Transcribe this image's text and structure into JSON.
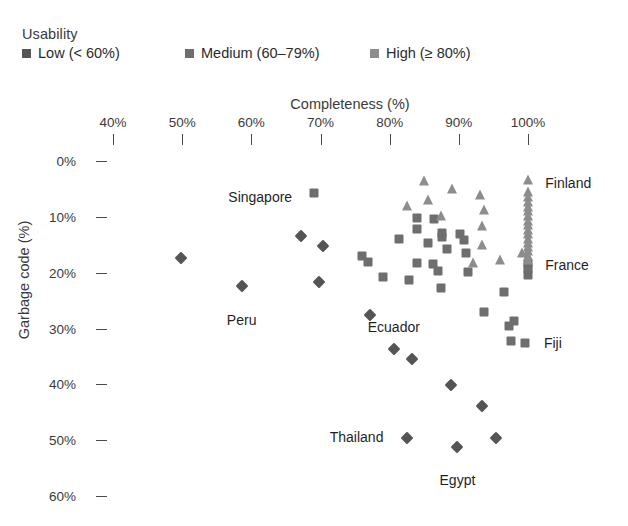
{
  "legend": {
    "title": "Usability",
    "items": [
      {
        "label": "Low (< 60%)",
        "color": "#555555",
        "shape": "diamond",
        "x": 0
      },
      {
        "label": "Medium (60–79%)",
        "color": "#6e6e6e",
        "shape": "square",
        "x": 163
      },
      {
        "label": "High (≥ 80%)",
        "color": "#8d8d8d",
        "shape": "triangle",
        "x": 348
      }
    ]
  },
  "axes": {
    "x_title": "Completeness (%)",
    "y_title": "Garbage code (%)",
    "x_ticks": [
      "40%",
      "50%",
      "60%",
      "70%",
      "80%",
      "90%",
      "100%"
    ],
    "x_tick_values": [
      40,
      50,
      60,
      70,
      80,
      90,
      100
    ],
    "y_ticks": [
      "0%",
      "10%",
      "20%",
      "30%",
      "40%",
      "50%",
      "60%"
    ],
    "y_tick_values": [
      0,
      10,
      20,
      30,
      40,
      50,
      60
    ],
    "x_range": [
      33.6,
      104.6
    ],
    "y_range": [
      -1.1,
      61.5
    ]
  },
  "point_labels": [
    {
      "text": "Singapore",
      "x": 67.2,
      "y": 6.4,
      "anchor": "r"
    },
    {
      "text": "Peru",
      "x": 58.6,
      "y": 25.8,
      "anchor": "b"
    },
    {
      "text": "Ecuador",
      "x": 80.6,
      "y": 27.0,
      "anchor": "b"
    },
    {
      "text": "Thailand",
      "x": 80.4,
      "y": 49.5,
      "anchor": "r"
    },
    {
      "text": "Egypt",
      "x": 89.8,
      "y": 54.5,
      "anchor": "b"
    },
    {
      "text": "Finland",
      "x": 101.2,
      "y": 4.0,
      "anchor": "l"
    },
    {
      "text": "France",
      "x": 101.2,
      "y": 18.6,
      "anchor": "l"
    },
    {
      "text": "Fiji",
      "x": 101.0,
      "y": 32.6,
      "anchor": "l"
    }
  ],
  "chart_data": {
    "type": "scatter",
    "title": "",
    "xlabel": "Completeness (%)",
    "ylabel": "Garbage code (%)",
    "xlim": [
      33.6,
      104.6
    ],
    "ylim": [
      -1.1,
      61.5
    ],
    "y_axis_inverted": true,
    "grid": false,
    "legend_position": "top-left",
    "legend_title": "Usability",
    "series": [
      {
        "name": "Low (< 60%)",
        "shape": "diamond",
        "color": "#555555",
        "points": [
          {
            "x": 49.9,
            "y": 17.4
          },
          {
            "x": 67.2,
            "y": 13.5
          },
          {
            "x": 70.3,
            "y": 15.2
          },
          {
            "x": 58.6,
            "y": 22.3
          },
          {
            "x": 69.8,
            "y": 21.6
          },
          {
            "x": 77.2,
            "y": 27.6
          },
          {
            "x": 80.6,
            "y": 33.6
          },
          {
            "x": 83.2,
            "y": 35.4
          },
          {
            "x": 88.8,
            "y": 40.1
          },
          {
            "x": 93.4,
            "y": 43.8
          },
          {
            "x": 82.5,
            "y": 49.6
          },
          {
            "x": 89.8,
            "y": 51.3
          },
          {
            "x": 95.4,
            "y": 49.7
          }
        ]
      },
      {
        "name": "Medium (60–79%)",
        "shape": "square",
        "color": "#6e6e6e",
        "points": [
          {
            "x": 69.0,
            "y": 5.7
          },
          {
            "x": 84.0,
            "y": 10.2
          },
          {
            "x": 86.4,
            "y": 10.3
          },
          {
            "x": 83.9,
            "y": 12.2
          },
          {
            "x": 87.5,
            "y": 12.9
          },
          {
            "x": 87.6,
            "y": 13.7
          },
          {
            "x": 81.3,
            "y": 13.9
          },
          {
            "x": 85.6,
            "y": 14.6
          },
          {
            "x": 90.1,
            "y": 13.1
          },
          {
            "x": 88.3,
            "y": 15.8
          },
          {
            "x": 90.8,
            "y": 14.1
          },
          {
            "x": 76.0,
            "y": 17.0
          },
          {
            "x": 76.9,
            "y": 18.1
          },
          {
            "x": 84.0,
            "y": 18.2
          },
          {
            "x": 86.3,
            "y": 18.4
          },
          {
            "x": 91.0,
            "y": 16.5
          },
          {
            "x": 87.0,
            "y": 19.7
          },
          {
            "x": 91.3,
            "y": 19.9
          },
          {
            "x": 79.0,
            "y": 20.7
          },
          {
            "x": 82.8,
            "y": 21.4
          },
          {
            "x": 87.4,
            "y": 22.7
          },
          {
            "x": 96.5,
            "y": 23.4
          },
          {
            "x": 93.6,
            "y": 27.0
          },
          {
            "x": 97.3,
            "y": 29.5
          },
          {
            "x": 98.0,
            "y": 28.6
          },
          {
            "x": 97.6,
            "y": 32.3
          },
          {
            "x": 99.5,
            "y": 32.6
          },
          {
            "x": 100.0,
            "y": 19.4
          },
          {
            "x": 100.0,
            "y": 20.4
          },
          {
            "x": 100.0,
            "y": 18.5
          }
        ]
      },
      {
        "name": "High (≥ 80%)",
        "shape": "triangle",
        "color": "#8d8d8d",
        "points": [
          {
            "x": 85.0,
            "y": 3.5
          },
          {
            "x": 85.6,
            "y": 7.0
          },
          {
            "x": 82.5,
            "y": 8.0
          },
          {
            "x": 89.0,
            "y": 5.0
          },
          {
            "x": 93.0,
            "y": 6.0
          },
          {
            "x": 93.7,
            "y": 8.7
          },
          {
            "x": 87.4,
            "y": 9.8
          },
          {
            "x": 93.3,
            "y": 11.7
          },
          {
            "x": 93.3,
            "y": 15.0
          },
          {
            "x": 92.0,
            "y": 18.3
          },
          {
            "x": 96.0,
            "y": 17.8
          },
          {
            "x": 100.0,
            "y": 3.4
          },
          {
            "x": 100.0,
            "y": 5.5
          },
          {
            "x": 100.0,
            "y": 6.5
          },
          {
            "x": 100.0,
            "y": 7.4
          },
          {
            "x": 100.0,
            "y": 8.2
          },
          {
            "x": 100.0,
            "y": 9.0
          },
          {
            "x": 100.0,
            "y": 9.9
          },
          {
            "x": 100.0,
            "y": 10.7
          },
          {
            "x": 100.0,
            "y": 11.5
          },
          {
            "x": 100.0,
            "y": 12.3
          },
          {
            "x": 100.0,
            "y": 13.1
          },
          {
            "x": 100.0,
            "y": 13.9
          },
          {
            "x": 100.0,
            "y": 14.6
          },
          {
            "x": 100.0,
            "y": 15.4
          },
          {
            "x": 100.0,
            "y": 16.2
          },
          {
            "x": 100.0,
            "y": 17.0
          },
          {
            "x": 100.0,
            "y": 17.7
          },
          {
            "x": 99.2,
            "y": 16.4
          }
        ]
      }
    ]
  }
}
